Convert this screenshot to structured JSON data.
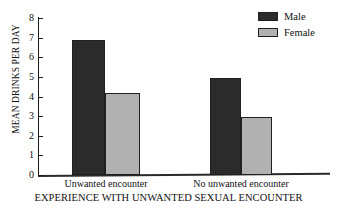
{
  "chart_data": {
    "type": "bar",
    "title": "",
    "subtitle": "",
    "xlabel": "EXPERIENCE WITH UNWANTED SEXUAL ENCOUNTER",
    "ylabel": "MEAN DRINKS PER DAY",
    "categories": [
      "Unwanted encounter",
      "No unwanted encounter"
    ],
    "series": [
      {
        "name": "Male",
        "values": [
          6.9,
          4.95
        ],
        "color": "#2b2b2b"
      },
      {
        "name": "Female",
        "values": [
          4.2,
          2.95
        ],
        "color": "#b1b1b1"
      }
    ],
    "ylim": [
      0,
      8
    ],
    "yticks": [
      0,
      1,
      2,
      3,
      4,
      5,
      6,
      7,
      8
    ],
    "ytick_labels": [
      "0",
      "1",
      "2",
      "3",
      "4",
      "5",
      "6",
      "7",
      "8"
    ],
    "grid": false,
    "legend_position": "top-right"
  },
  "legend": {
    "items": [
      {
        "label": "Male"
      },
      {
        "label": "Female"
      }
    ]
  }
}
